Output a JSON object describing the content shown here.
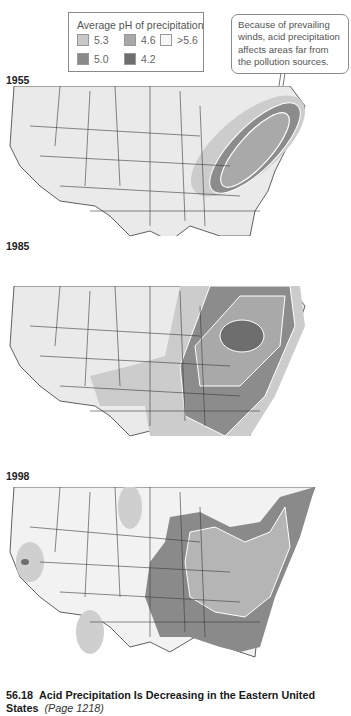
{
  "legend": {
    "title": "Average pH of precipitation",
    "items": [
      {
        "label": "5.3",
        "color": "#c9c9c9"
      },
      {
        "label": "4.6",
        "color": "#a8a8a8"
      },
      {
        "label": ">5.6",
        "color": "#f4f4f4"
      },
      {
        "label": "5.0",
        "color": "#8a8a8a"
      },
      {
        "label": "4.2",
        "color": "#6e6e6e"
      }
    ]
  },
  "callout": {
    "text": "Because of prevailing winds, acid precipitation affects areas far from the pollution sources."
  },
  "maps": [
    {
      "year": "1955"
    },
    {
      "year": "1985"
    },
    {
      "year": "1998"
    }
  ],
  "caption": {
    "number": "56.18",
    "title": "Acid Precipitation Is Decreasing in the Eastern United States",
    "page_ref": "(Page 1218)"
  },
  "colors": {
    "land": "#e9e9e9",
    "border": "#3a3a3a",
    "ph_5_6_plus": "#f4f4f4",
    "ph_5_3": "#c9c9c9",
    "ph_5_0": "#8a8a8a",
    "ph_4_6": "#a8a8a8",
    "ph_4_2": "#6e6e6e",
    "contour": "#ffffff"
  }
}
